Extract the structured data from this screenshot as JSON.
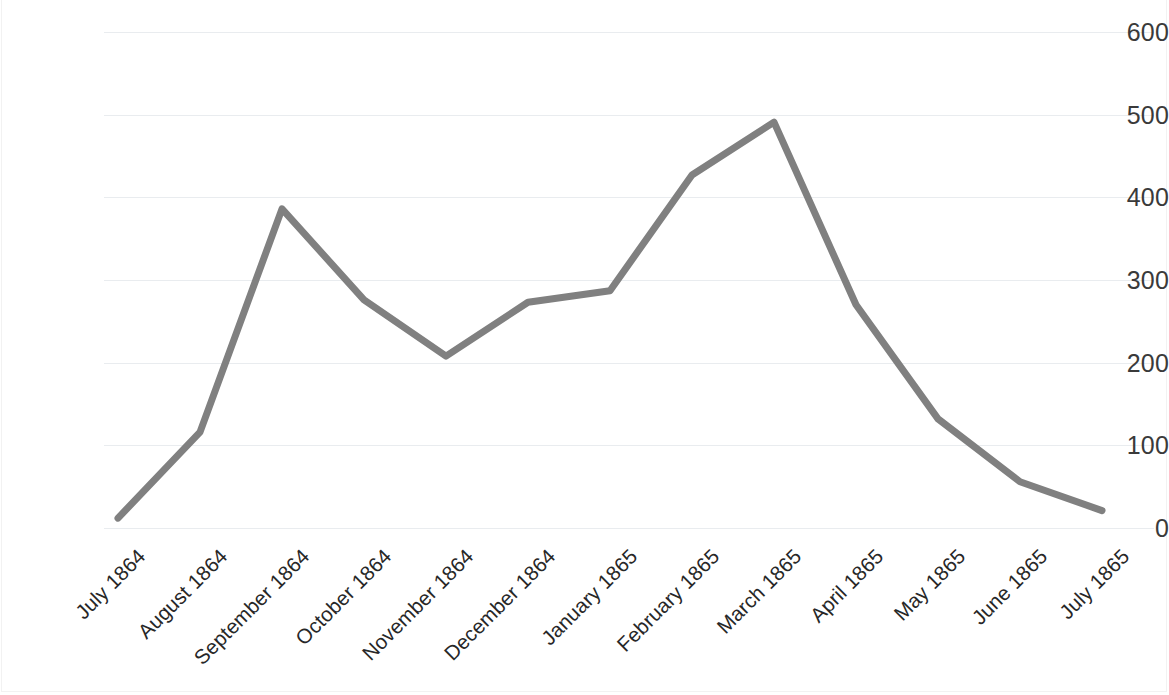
{
  "chart_data": {
    "type": "line",
    "title": "",
    "subtitle": "",
    "xlabel": "",
    "ylabel": "",
    "categories": [
      "July 1864",
      "August 1864",
      "September 1864",
      "October 1864",
      "November 1864",
      "December 1864",
      "January 1865",
      "February 1865",
      "March 1865",
      "April 1865",
      "May 1865",
      "June 1865",
      "July 1865"
    ],
    "values": [
      12,
      116,
      386,
      276,
      208,
      273,
      287,
      427,
      491,
      270,
      132,
      56,
      21
    ],
    "series": [
      {
        "name": "",
        "color": "#808080",
        "values": [
          12,
          116,
          386,
          276,
          208,
          273,
          287,
          427,
          491,
          270,
          132,
          56,
          21
        ]
      }
    ],
    "ylim": [
      0,
      600
    ],
    "y_ticks": [
      0,
      100,
      200,
      300,
      400,
      500,
      600
    ],
    "y_tick_labels": [
      "0",
      "100",
      "200",
      "300",
      "400",
      "500",
      "600"
    ],
    "grid": {
      "horizontal": true,
      "vertical": false,
      "color": "#e9ecef"
    },
    "legend": {
      "visible": false,
      "position": "none",
      "entries": []
    },
    "annotations": [],
    "line_style": {
      "color": "#808080",
      "width": 7,
      "markers": false,
      "smooth": false
    },
    "axis": {
      "x_tick_label_rotation": -45,
      "x_axis_line": false,
      "y_axis_line": false
    },
    "background_color": "#ffffff",
    "text_color": "#3a3a3a"
  }
}
